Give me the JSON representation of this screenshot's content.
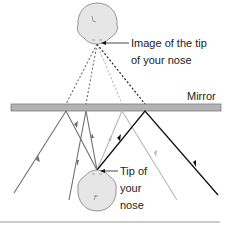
{
  "diagram": {
    "type": "mirror-reflection-ray-diagram",
    "labels": {
      "image_line1": "Image of the tip",
      "image_line2": "of your nose",
      "mirror": "Mirror",
      "tip_line1": "Tip of",
      "tip_line2": "your",
      "tip_line3": "nose"
    },
    "colors": {
      "mirror_fill": "#b3b3b3",
      "mirror_stroke": "#7a7a7a",
      "head_fill": "#e6e6e6",
      "head_stroke": "#888888",
      "ray_dark": "#111111",
      "ray_mid": "#6e6e6e",
      "ray_light": "#b8b8b8",
      "rule": "#999999"
    }
  }
}
